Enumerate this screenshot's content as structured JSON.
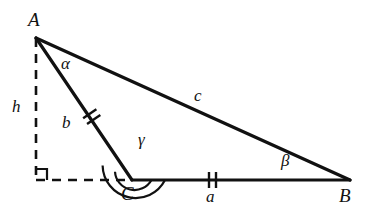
{
  "figure": {
    "type": "geometry-diagram",
    "background_color": "#ffffff",
    "stroke_color": "#111111",
    "width": 369,
    "height": 217
  },
  "vertices": [
    {
      "id": "A",
      "label": "A",
      "x": 36,
      "y": 38,
      "label_x": 28,
      "label_y": 10
    },
    {
      "id": "C",
      "label": "C",
      "x": 132,
      "y": 180,
      "label_x": 121,
      "label_y": 184
    },
    {
      "id": "B",
      "label": "B",
      "x": 350,
      "y": 180,
      "label_x": 339,
      "label_y": 186
    }
  ],
  "altitude": {
    "label": "h",
    "label_x": 12,
    "label_y": 98,
    "foot_x": 36,
    "foot_y": 180,
    "from_x": 36,
    "from_y": 38,
    "style": "dashed",
    "right_angle_marker": true
  },
  "baseline_extension": {
    "style": "dashed",
    "from_x": 36,
    "from_y": 180,
    "to_x": 132,
    "to_y": 180
  },
  "sides": [
    {
      "id": "b",
      "label": "b",
      "from": "A",
      "to": "C",
      "label_x": 62,
      "label_y": 114,
      "tick_count": 2,
      "tick_x": 92,
      "tick_y": 117
    },
    {
      "id": "c",
      "label": "c",
      "from": "A",
      "to": "B",
      "label_x": 194,
      "label_y": 87,
      "tick_count": 0
    },
    {
      "id": "a",
      "label": "a",
      "from": "C",
      "to": "B",
      "label_x": 206,
      "label_y": 188,
      "tick_count": 2,
      "tick_x": 212,
      "tick_y": 180
    }
  ],
  "angles": [
    {
      "id": "alpha",
      "label": "α",
      "at_vertex": "A",
      "label_x": 61,
      "label_y": 55,
      "arc_count": 0
    },
    {
      "id": "gamma",
      "label": "γ",
      "at_vertex": "C",
      "label_x": 138,
      "label_y": 131,
      "arc_count": 2,
      "obtuse": true
    },
    {
      "id": "beta",
      "label": "β",
      "at_vertex": "B",
      "label_x": 281,
      "label_y": 152,
      "arc_count": 0
    }
  ]
}
